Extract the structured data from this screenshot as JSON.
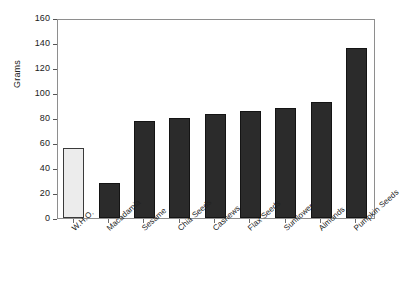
{
  "chart_data": {
    "type": "bar",
    "title": "",
    "xlabel": "",
    "ylabel": "Grams",
    "categories": [
      "W.H.O.",
      "Macadamia",
      "Sesame",
      "Chia Seeds",
      "Cashews",
      "Flax Seeds",
      "Sunflower",
      "Almonds",
      "Pumpkin Seeds"
    ],
    "values": [
      56,
      28,
      78,
      80,
      83,
      86,
      88,
      93,
      136
    ],
    "ylim": [
      0,
      160
    ],
    "yticks": [
      0,
      20,
      40,
      60,
      80,
      100,
      120,
      140,
      160
    ],
    "ytick_labels": [
      "0",
      "20",
      "40",
      "60",
      "80",
      "100",
      "120",
      "140",
      "160"
    ],
    "grid": false,
    "legend": "none",
    "bar_colors": [
      "#ececec",
      "#2b2b2b",
      "#2b2b2b",
      "#2b2b2b",
      "#2b2b2b",
      "#2b2b2b",
      "#2b2b2b",
      "#2b2b2b",
      "#2b2b2b"
    ],
    "bar_edge_colors": [
      "#3a3a3a",
      "#141414",
      "#141414",
      "#141414",
      "#141414",
      "#141414",
      "#141414",
      "#141414",
      "#141414"
    ],
    "frame_color": "#8e8e8e",
    "background": "#ffffff",
    "text_color": "#222222"
  }
}
